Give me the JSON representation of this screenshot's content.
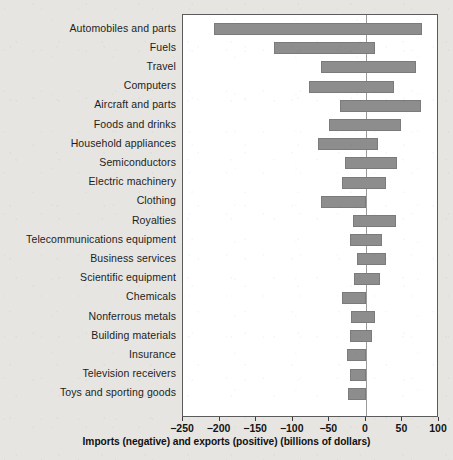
{
  "chart_data": {
    "type": "bar",
    "orientation": "horizontal",
    "title": "",
    "xlabel": "Imports (negative) and exports (positive) (billions of dollars)",
    "ylabel": "",
    "xlim": [
      -250,
      100
    ],
    "xticks": [
      -250,
      -200,
      -150,
      -100,
      -50,
      0,
      50,
      100
    ],
    "xtick_labels": [
      "−250",
      "−200",
      "−150",
      "−100",
      "−50",
      "0",
      "50",
      "100"
    ],
    "grid": false,
    "legend": null,
    "bar_color": "#8d8d8d",
    "zero_line_color": "#9a9a9a",
    "categories": [
      "Automobiles and parts",
      "Fuels",
      "Travel",
      "Computers",
      "Aircraft and parts",
      "Foods and drinks",
      "Household appliances",
      "Semiconductors",
      "Electric machinery",
      "Clothing",
      "Royalties",
      "Telecommunications equipment",
      "Business services",
      "Scientific equipment",
      "Chemicals",
      "Nonferrous metals",
      "Building materials",
      "Insurance",
      "Television receivers",
      "Toys and sporting goods"
    ],
    "series": [
      {
        "name": "Imports (negative)",
        "values": [
          -208,
          -125,
          -62,
          -78,
          -35,
          -50,
          -65,
          -28,
          -32,
          -62,
          -18,
          -22,
          -12,
          -16,
          -32,
          -20,
          -22,
          -26,
          -22,
          -24
        ]
      },
      {
        "name": "Exports (positive)",
        "values": [
          77,
          13,
          68,
          38,
          76,
          48,
          16,
          42,
          28,
          0,
          41,
          22,
          28,
          19,
          0,
          13,
          8,
          0,
          0,
          0
        ]
      }
    ],
    "bars": [
      {
        "label": "Automobiles and parts",
        "imports": -208,
        "exports": 77
      },
      {
        "label": "Fuels",
        "imports": -125,
        "exports": 13
      },
      {
        "label": "Travel",
        "imports": -62,
        "exports": 68
      },
      {
        "label": "Computers",
        "imports": -78,
        "exports": 38
      },
      {
        "label": "Aircraft and parts",
        "imports": -35,
        "exports": 76
      },
      {
        "label": "Foods and drinks",
        "imports": -50,
        "exports": 48
      },
      {
        "label": "Household appliances",
        "imports": -65,
        "exports": 16
      },
      {
        "label": "Semiconductors",
        "imports": -28,
        "exports": 42
      },
      {
        "label": "Electric machinery",
        "imports": -32,
        "exports": 28
      },
      {
        "label": "Clothing",
        "imports": -62,
        "exports": 0
      },
      {
        "label": "Royalties",
        "imports": -18,
        "exports": 41
      },
      {
        "label": "Telecommunications equipment",
        "imports": -22,
        "exports": 22
      },
      {
        "label": "Business services",
        "imports": -12,
        "exports": 28
      },
      {
        "label": "Scientific equipment",
        "imports": -16,
        "exports": 19
      },
      {
        "label": "Chemicals",
        "imports": -32,
        "exports": 0
      },
      {
        "label": "Nonferrous metals",
        "imports": -20,
        "exports": 13
      },
      {
        "label": "Building materials",
        "imports": -22,
        "exports": 8
      },
      {
        "label": "Insurance",
        "imports": -26,
        "exports": 0
      },
      {
        "label": "Television receivers",
        "imports": -22,
        "exports": 0
      },
      {
        "label": "Toys and sporting goods",
        "imports": -24,
        "exports": 0
      }
    ]
  }
}
